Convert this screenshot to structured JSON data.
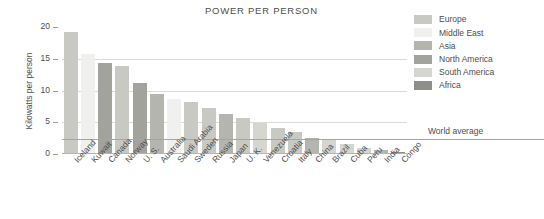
{
  "chart_data": {
    "type": "bar",
    "title": "POWER PER PERSON",
    "xlabel": "",
    "ylabel": "Kilowatts per person",
    "ylim": [
      0,
      20
    ],
    "yticks": [
      0,
      5,
      10,
      15,
      20
    ],
    "grid": true,
    "legend_position": "top-right",
    "categories": [
      "Iceland",
      "Kuwait",
      "Canada",
      "Norway",
      "U. S.",
      "Australia",
      "Saudi Arabia",
      "Sweden",
      "Russia",
      "Japan",
      "U. K.",
      "Venezuela",
      "Croatia",
      "Italy",
      "China",
      "Brazil",
      "Cuba",
      "Peru",
      "India",
      "Congo"
    ],
    "values": [
      19.2,
      15.7,
      14.4,
      13.9,
      11.2,
      9.4,
      8.6,
      8.2,
      7.2,
      6.3,
      5.6,
      4.9,
      4.1,
      3.4,
      2.6,
      2.2,
      1.5,
      1.0,
      0.7,
      0.3
    ],
    "series": [
      {
        "name": "Power per person (kilowatts)",
        "values": [
          19.2,
          15.7,
          14.4,
          13.9,
          11.2,
          9.4,
          8.6,
          8.2,
          7.2,
          6.3,
          5.6,
          4.9,
          4.1,
          3.4,
          2.6,
          2.2,
          1.5,
          1.0,
          0.7,
          0.3
        ],
        "regions": [
          "Europe",
          "Middle East",
          "North America",
          "Europe",
          "North America",
          "Asia",
          "Middle East",
          "Europe",
          "Europe",
          "Asia",
          "Europe",
          "South America",
          "Europe",
          "Europe",
          "Asia",
          "South America",
          "South America",
          "South America",
          "Asia",
          "Africa"
        ]
      }
    ],
    "annotations": [
      {
        "label": "World average",
        "value": 2.4,
        "type": "horizontal-reference-line"
      }
    ],
    "legend": [
      {
        "label": "Europe",
        "color": "#c9c9c4"
      },
      {
        "label": "Middle East",
        "color": "#f0f0ee"
      },
      {
        "label": "Asia",
        "color": "#b5b5b0"
      },
      {
        "label": "North America",
        "color": "#a3a39e"
      },
      {
        "label": "South America",
        "color": "#d6d6d1"
      },
      {
        "label": "Africa",
        "color": "#8f8f8a"
      }
    ]
  },
  "colors": {
    "europe": "#c9c9c4",
    "middle_east": "#f0f0ee",
    "asia": "#b5b5b0",
    "north_america": "#a3a39e",
    "south_america": "#d6d6d1",
    "africa": "#8f8f8a",
    "gridline": "#dedbd6",
    "axis": "#9a9a9a",
    "text": "#4d4d4d",
    "background": "#ffffff"
  },
  "world_average_label": "World average"
}
